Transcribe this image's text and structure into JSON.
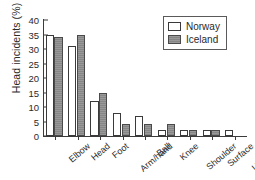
{
  "chart_data": {
    "type": "bar",
    "title": "",
    "xlabel": "",
    "ylabel": "Head incidents (%)",
    "ylim": [
      0,
      40
    ],
    "ytick_step": 5,
    "yticks": [
      0,
      5,
      10,
      15,
      20,
      25,
      30,
      35,
      40
    ],
    "grid": false,
    "legend_position": "top-right",
    "categories": [
      "Elbow",
      "Head",
      "Foot",
      "Arm/hand",
      "Ball",
      "Knee",
      "Shoulder",
      "Surface",
      "Unknown"
    ],
    "series": [
      {
        "name": "Norway",
        "color": "#ffffff",
        "values": [
          35,
          31,
          12,
          8,
          7,
          2,
          2,
          2,
          2
        ]
      },
      {
        "name": "Iceland",
        "color": "#8d8d8d",
        "values": [
          34,
          35,
          15,
          4,
          4,
          4,
          2,
          2,
          null
        ]
      }
    ]
  },
  "legend": {
    "entries": [
      {
        "label": "Norway",
        "swatch": "norway"
      },
      {
        "label": "Iceland",
        "swatch": "iceland"
      }
    ]
  },
  "colors": {
    "axis": "#3b3b3b",
    "text": "#2a2a2a",
    "norway_fill": "#ffffff",
    "iceland_fill": "#8d8d8d",
    "background": "#ffffff"
  }
}
